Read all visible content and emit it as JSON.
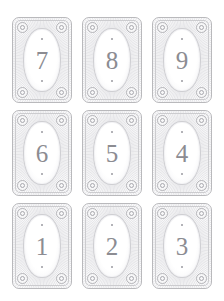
{
  "page": {
    "background_color": "#ffffff",
    "width": 224,
    "height": 301
  },
  "style": {
    "card_border_color": "#b9b9bc",
    "card_inner_rule_color": "#cccccf",
    "burst_line_color": "#c8c8cd",
    "oval_fill_color": "#ffffff",
    "oval_border_color": "#cfcfd3",
    "numeral_color": "#8c8c92",
    "pip_color": "#9a9aa0",
    "rosette_fill_color": "#f7f7f8",
    "rosette_border_color": "#b4b4b8"
  },
  "grid": {
    "columns": 3,
    "rows": 3,
    "card_width": 60,
    "card_height": 86,
    "column_gap": 10,
    "row_gap": 7
  },
  "cards": [
    {
      "numeral": "7",
      "row": 1,
      "column": 1,
      "pip_top": "•",
      "pip_bottom": "•"
    },
    {
      "numeral": "8",
      "row": 1,
      "column": 2,
      "pip_top": "•",
      "pip_bottom": "•"
    },
    {
      "numeral": "9",
      "row": 1,
      "column": 3,
      "pip_top": "•",
      "pip_bottom": "•"
    },
    {
      "numeral": "6",
      "row": 2,
      "column": 1,
      "pip_top": "•",
      "pip_bottom": "•"
    },
    {
      "numeral": "5",
      "row": 2,
      "column": 2,
      "pip_top": "•",
      "pip_bottom": "•"
    },
    {
      "numeral": "4",
      "row": 2,
      "column": 3,
      "pip_top": "•",
      "pip_bottom": "•"
    },
    {
      "numeral": "1",
      "row": 3,
      "column": 1,
      "pip_top": "•",
      "pip_bottom": "•"
    },
    {
      "numeral": "2",
      "row": 3,
      "column": 2,
      "pip_top": "•",
      "pip_bottom": "•"
    },
    {
      "numeral": "3",
      "row": 3,
      "column": 3,
      "pip_top": "•",
      "pip_bottom": "•"
    }
  ]
}
